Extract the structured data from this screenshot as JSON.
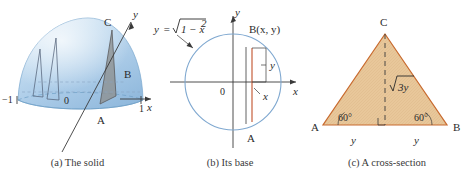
{
  "figure": {
    "panels": [
      {
        "id": "a",
        "caption": "(a) The solid",
        "labels": {
          "axis_y": "y",
          "axis_x": "x",
          "origin": "0",
          "left_tick": "−1",
          "right_tick": "1",
          "point_a": "A",
          "point_b": "B",
          "point_c": "C"
        }
      },
      {
        "id": "b",
        "caption": "(b) Its base",
        "labels": {
          "curve_equation": "y = √1 − x²",
          "equation_y": "y",
          "equation_eq": "=",
          "equation_radicand": "1 − x",
          "equation_exponent": "2",
          "axis_y": "y",
          "axis_x": "x",
          "origin": "0",
          "point_b": "B(x, y)",
          "segment_y": "y",
          "segment_x": "x",
          "point_a": "A"
        }
      },
      {
        "id": "c",
        "caption": "(c) A cross-section",
        "labels": {
          "vertex_a": "A",
          "vertex_b": "B",
          "vertex_c": "C",
          "angle_left": "60°",
          "angle_right": "60°",
          "height": "√3y",
          "height_radical": "√",
          "height_value": "3y",
          "base_left": "y",
          "base_right": "y"
        }
      }
    ]
  },
  "colors": {
    "dome_light": "#cfe2f3",
    "dome_mid": "#a8c8e4",
    "dome_edge": "#7aa8cf",
    "slice_gray": "#8d8f90",
    "triangle_fill": "#e8c79a",
    "triangle_stroke": "#c86a2e",
    "circle_stroke": "#7fa8d0",
    "axis": "#3a3a3a",
    "chord_red": "#c0502a",
    "text": "#2b2b2b"
  }
}
